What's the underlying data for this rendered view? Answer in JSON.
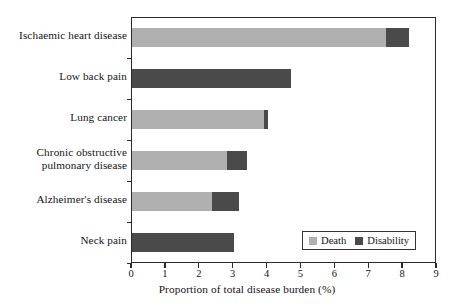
{
  "chart_data": {
    "type": "bar",
    "orientation": "horizontal",
    "stacked": true,
    "title": "",
    "xlabel": "Proportion of total disease burden (%)",
    "ylabel": "",
    "xlim": [
      0,
      9
    ],
    "xticks": [
      0,
      1,
      2,
      3,
      4,
      5,
      6,
      7,
      8,
      9
    ],
    "xtick_labels": [
      "0",
      "1",
      "2",
      "3",
      "4",
      "5",
      "6",
      "7",
      "8",
      "9"
    ],
    "grid": false,
    "legend_position": "bottom-right",
    "categories": [
      "Ischaemic heart disease",
      "Low back pain",
      "Lung cancer",
      "Chronic obstructive pulmonary disease",
      "Alzheimer's disease",
      "Neck pain"
    ],
    "series": [
      {
        "name": "Death",
        "color": "#b0b0b0",
        "values": [
          7.5,
          0,
          3.9,
          2.8,
          2.35,
          0
        ]
      },
      {
        "name": "Disability",
        "color": "#4a4a4a",
        "values": [
          0.68,
          4.7,
          0.1,
          0.6,
          0.8,
          3.0
        ]
      }
    ],
    "totals": [
      8.18,
      4.7,
      4.0,
      3.4,
      3.15,
      3.0
    ]
  },
  "axis": {
    "x_title": "Proportion of total disease burden (%)",
    "tick_labels": [
      "0",
      "1",
      "2",
      "3",
      "4",
      "5",
      "6",
      "7",
      "8",
      "9"
    ]
  },
  "categories": [
    {
      "label": "Ischaemic heart disease"
    },
    {
      "label": "Low back pain"
    },
    {
      "label": "Lung cancer"
    },
    {
      "label": "Chronic obstructive\npulmonary disease"
    },
    {
      "label": "Alzheimer's disease"
    },
    {
      "label": "Neck pain"
    }
  ],
  "legend": {
    "items": [
      {
        "label": "Death",
        "color": "#b0b0b0"
      },
      {
        "label": "Disability",
        "color": "#4a4a4a"
      }
    ]
  }
}
